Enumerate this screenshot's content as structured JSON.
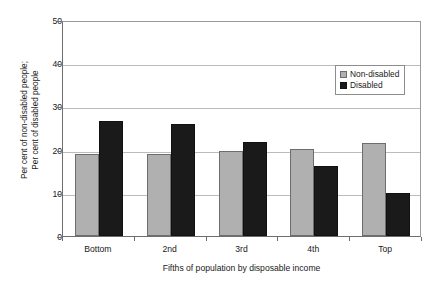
{
  "chart_data": {
    "type": "bar",
    "title": "",
    "xlabel": "Fifths of population by disposable income",
    "ylabel": "Per cent of non-disabled people; Per cent of disabled people",
    "ylabel_lines": [
      "Per cent of non-disabled people;",
      "Per cent of disabled people"
    ],
    "categories": [
      "Bottom",
      "2nd",
      "3rd",
      "4th",
      "Top"
    ],
    "series": [
      {
        "name": "Non-disabled",
        "color": "#b0b0b0",
        "values": [
          19.0,
          19.1,
          19.7,
          20.2,
          21.5
        ]
      },
      {
        "name": "Disabled",
        "color": "#1a1a1a",
        "values": [
          26.7,
          26.0,
          21.8,
          16.3,
          10.0
        ]
      }
    ],
    "ylim": [
      0,
      50
    ],
    "yticks": [
      0,
      10,
      20,
      30,
      40,
      50
    ],
    "ytick_labels": [
      "0",
      "10",
      "20",
      "30",
      "40",
      "50"
    ],
    "grid": true,
    "legend_position": "top-right-inside",
    "xlim_categories": 5
  },
  "legend": {
    "items": [
      {
        "label": "Non-disabled",
        "swatch": "nondisabled"
      },
      {
        "label": "Disabled",
        "swatch": "disabled"
      }
    ]
  },
  "colors": {
    "nondisabled": "#b0b0b0",
    "disabled": "#1a1a1a",
    "gridline": "#bcbcbc",
    "axis": "#6e6e6e",
    "background": "#ffffff"
  }
}
